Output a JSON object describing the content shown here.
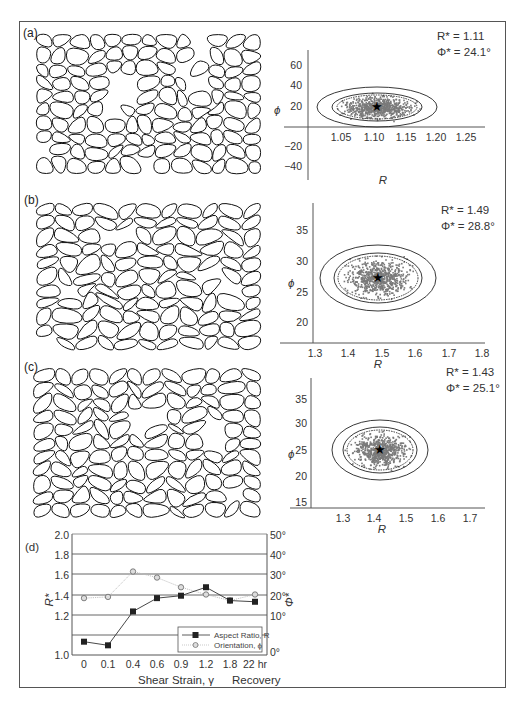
{
  "panels": [
    {
      "label": "(a)",
      "stats": {
        "R_label": "R* = 1.11",
        "Phi_label": "Φ* = 24.1°"
      },
      "xlabel": "R",
      "ylabel": "ϕ",
      "xticks": [
        "1.05",
        "1.10",
        "1.15",
        "1.20",
        "1.25"
      ],
      "yticks": [
        "60",
        "40",
        "20",
        "−20",
        "−40"
      ]
    },
    {
      "label": "(b)",
      "stats": {
        "R_label": "R* = 1.49",
        "Phi_label": "Φ* = 28.8°"
      },
      "xlabel": "R",
      "ylabel": "ϕ",
      "xticks": [
        "1.3",
        "1.4",
        "1.5",
        "1.6",
        "1.7",
        "1.8"
      ],
      "yticks": [
        "35",
        "30",
        "25",
        "20"
      ]
    },
    {
      "label": "(c)",
      "stats": {
        "R_label": "R* = 1.43",
        "Phi_label": "Φ* = 25.1°"
      },
      "xlabel": "R",
      "ylabel": "ϕ",
      "xticks": [
        "1.3",
        "1.4",
        "1.5",
        "1.6",
        "1.7"
      ],
      "yticks": [
        "35",
        "30",
        "25",
        "20",
        "15"
      ]
    }
  ],
  "panel_d": {
    "label": "(d)",
    "left_yticks": [
      "2.0",
      "1.8",
      "1.6",
      "1.4",
      "1.2",
      "1.0"
    ],
    "right_yticks": [
      "50°",
      "40°",
      "30°",
      "20°",
      "10°",
      "0°"
    ],
    "left_ylabel": "R*",
    "right_ylabel": "Φ*",
    "xticks": [
      "0",
      "0.1",
      "0.4",
      "0.6",
      "0.9",
      "1.2",
      "1.8",
      "22 hr"
    ],
    "xlabel": "Shear Strain, γ",
    "xlabel_right": "Recovery",
    "legend": {
      "series1": "Aspect Ratio, R",
      "series2": "Orientation, ϕ"
    }
  },
  "chart_data": [
    {
      "type": "scatter",
      "title": "(a) Rf/ϕ distribution",
      "xlabel": "R",
      "ylabel": "ϕ",
      "xlim": [
        1.0,
        1.28
      ],
      "ylim": [
        -45,
        75
      ],
      "center": {
        "R": 1.11,
        "phi": 24.1
      },
      "annotations": [
        "R* = 1.11",
        "Φ* = 24.1°"
      ],
      "note": "dense cloud of points with three confidence ellipses centred on star"
    },
    {
      "type": "scatter",
      "title": "(b) Rf/ϕ distribution",
      "xlabel": "R",
      "ylabel": "ϕ",
      "xlim": [
        1.22,
        1.8
      ],
      "ylim": [
        18,
        39
      ],
      "center": {
        "R": 1.49,
        "phi": 28.8
      },
      "annotations": [
        "R* = 1.49",
        "Φ* = 28.8°"
      ]
    },
    {
      "type": "scatter",
      "title": "(c) Rf/ϕ distribution",
      "xlabel": "R",
      "ylabel": "ϕ",
      "xlim": [
        1.2,
        1.75
      ],
      "ylim": [
        13,
        37
      ],
      "center": {
        "R": 1.43,
        "phi": 25.1
      },
      "annotations": [
        "R* = 1.43",
        "Φ* = 25.1°"
      ]
    },
    {
      "type": "line",
      "title": "(d) Aspect ratio and orientation vs shear strain",
      "categories": [
        "0",
        "0.1",
        "0.4",
        "0.6",
        "0.9",
        "1.2",
        "1.8",
        "22 hr"
      ],
      "xlabel": "Shear Strain, γ / Recovery",
      "series": [
        {
          "name": "Aspect Ratio, R",
          "axis": "left",
          "marker": "square",
          "values": [
            1.11,
            1.08,
            1.36,
            1.47,
            1.49,
            1.56,
            1.45,
            1.44
          ]
        },
        {
          "name": "Orientation, ϕ",
          "axis": "right",
          "marker": "circle",
          "values": [
            23.5,
            24,
            34.5,
            32,
            28,
            25,
            22.5,
            25
          ]
        }
      ],
      "ylabel_left": "R*",
      "ylim_left": [
        1.0,
        2.0
      ],
      "ylabel_right": "Φ*",
      "ylim_right": [
        0,
        50
      ],
      "grid": "horizontal"
    }
  ]
}
